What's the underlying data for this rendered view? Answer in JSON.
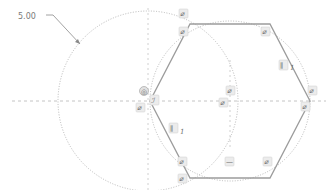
{
  "sketch": {
    "dimension": {
      "label": "5.00",
      "x": 18,
      "y": 19
    },
    "colors": {
      "construction": "#b4b4b4",
      "centerline": "#c8c8c8",
      "geometry": "#9a9a9a",
      "constraint_text": "#6b6b6b"
    },
    "circles": [
      {
        "name": "construction-circle-left",
        "cx": 148,
        "cy": 101,
        "r": 90
      },
      {
        "name": "construction-circle-hexagon",
        "cx": 230,
        "cy": 101,
        "r": 80
      }
    ],
    "hexagon": {
      "vertices": [
        [
          190,
          24
        ],
        [
          270,
          24
        ],
        [
          310,
          101
        ],
        [
          270,
          178
        ],
        [
          190,
          178
        ],
        [
          150,
          101
        ]
      ]
    },
    "constraints": [
      {
        "name": "coincident-top-left-a",
        "glyph": "⌀",
        "x": 183,
        "y": 16
      },
      {
        "name": "coincident-top-left-b",
        "glyph": "⌀",
        "x": 183,
        "y": 33
      },
      {
        "name": "coincident-top-right",
        "glyph": "⌀",
        "x": 265,
        "y": 33
      },
      {
        "name": "parallel-right",
        "glyph": "∥",
        "x": 282,
        "y": 67,
        "index": "1"
      },
      {
        "name": "coincident-right-a",
        "glyph": "⌀",
        "x": 312,
        "y": 92
      },
      {
        "name": "coincident-right-b",
        "glyph": "⌀",
        "x": 304,
        "y": 108
      },
      {
        "name": "coincident-center-a",
        "glyph": "⌀",
        "x": 227,
        "y": 92
      },
      {
        "name": "coincident-center-b",
        "glyph": "⌀",
        "x": 222,
        "y": 104
      },
      {
        "name": "fix-left",
        "glyph": "◎",
        "x": 140,
        "y": 90
      },
      {
        "name": "tangent-left",
        "glyph": "ℐ",
        "x": 152,
        "y": 100
      },
      {
        "name": "coincident-left",
        "glyph": "⌀",
        "x": 138,
        "y": 105
      },
      {
        "name": "parallel-left",
        "glyph": "∥",
        "x": 172,
        "y": 130,
        "index": "1"
      },
      {
        "name": "coincident-bottom-left-a",
        "glyph": "⌀",
        "x": 180,
        "y": 162
      },
      {
        "name": "coincident-bottom-left-b",
        "glyph": "⌀",
        "x": 180,
        "y": 178
      },
      {
        "name": "horizontal-bottom",
        "glyph": "—",
        "x": 228,
        "y": 163
      },
      {
        "name": "coincident-bottom-right",
        "glyph": "⌀",
        "x": 265,
        "y": 162
      }
    ]
  }
}
